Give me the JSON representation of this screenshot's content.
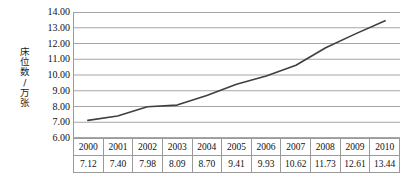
{
  "chart_data": {
    "type": "line",
    "title": "",
    "xlabel": "",
    "ylabel": "床位数/万张",
    "categories": [
      "2000",
      "2001",
      "2002",
      "2003",
      "2004",
      "2005",
      "2006",
      "2007",
      "2008",
      "2009",
      "2010"
    ],
    "values": [
      7.12,
      7.4,
      7.98,
      8.09,
      8.7,
      9.41,
      9.93,
      10.62,
      11.73,
      12.61,
      13.44
    ],
    "value_labels": [
      "7.12",
      "7.40",
      "7.98",
      "8.09",
      "8.70",
      "9.41",
      "9.93",
      "10.62",
      "11.73",
      "12.61",
      "13.44"
    ],
    "ylim": [
      6.0,
      14.0
    ],
    "ytick_values": [
      6.0,
      7.0,
      8.0,
      9.0,
      10.0,
      11.0,
      12.0,
      13.0,
      14.0
    ],
    "ytick_labels": [
      "6.00",
      "7.00",
      "8.00",
      "9.00",
      "10.00",
      "11.00",
      "12.00",
      "13.00",
      "14.00"
    ],
    "grid": true,
    "grid_axis": "y",
    "legend": false,
    "legend_position": "none",
    "series_name": "床位数",
    "line_color": "#3f3f3f",
    "grid_color": "#a6a6a6",
    "border_color": "#9a9a9a",
    "has_data_table": true,
    "table_rows": [
      {
        "row_name": "year-row",
        "cells": [
          "2000",
          "2001",
          "2002",
          "2003",
          "2004",
          "2005",
          "2006",
          "2007",
          "2008",
          "2009",
          "2010"
        ]
      },
      {
        "row_name": "value-row",
        "cells": [
          "7.12",
          "7.40",
          "7.98",
          "8.09",
          "8.70",
          "9.41",
          "9.93",
          "10.62",
          "11.73",
          "12.61",
          "13.44"
        ]
      }
    ]
  }
}
